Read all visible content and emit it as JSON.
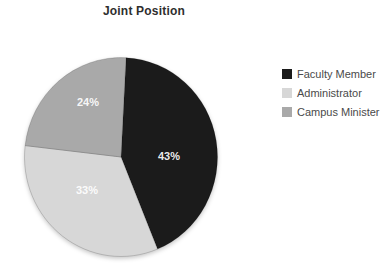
{
  "chart_data": {
    "type": "pie",
    "title": "Joint Position",
    "categories": [
      "Faculty Member",
      "Administrator",
      "Campus Minister"
    ],
    "values": [
      43,
      33,
      24
    ],
    "unit": "%",
    "slice_labels": [
      "43%",
      "33%",
      "24%"
    ],
    "colors": [
      "#1b1b1b",
      "#d7d7d7",
      "#a9a9a9"
    ],
    "legend_position": "right",
    "start_angle_deg": 3,
    "direction": "clockwise",
    "grid": false,
    "background": "#ffffff"
  }
}
